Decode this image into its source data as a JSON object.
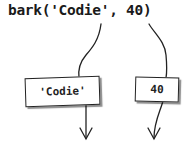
{
  "diagram": {
    "call_expression": "bark('Codie', 40)",
    "arguments": [
      {
        "value": "'Codie'"
      },
      {
        "value": "40"
      }
    ],
    "icons": [
      "arrow-down-icon",
      "arrow-down-icon"
    ]
  }
}
